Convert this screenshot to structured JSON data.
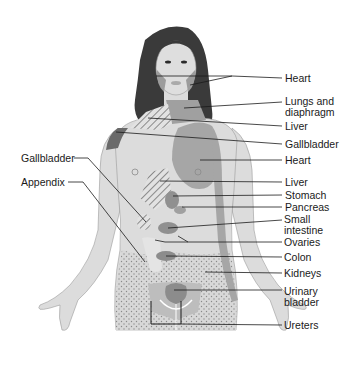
{
  "diagram": {
    "type": "referred-pain-anatomy",
    "colors": {
      "skin": "#dcdcdc",
      "hair": "#3a3a3a",
      "organ_dark": "#8c8c8c",
      "organ_mid": "#a6a6a6",
      "leader_line": "#1a1a1a",
      "text": "#1a1a1a",
      "background": "#ffffff"
    }
  },
  "labels_right": [
    {
      "id": "heart-jaw",
      "text": "Heart"
    },
    {
      "id": "lungs",
      "text": "Lungs and diaphragm"
    },
    {
      "id": "liver-neck",
      "text": "Liver"
    },
    {
      "id": "gallbladder-shoulder",
      "text": "Gallbladder"
    },
    {
      "id": "heart-chest",
      "text": "Heart"
    },
    {
      "id": "liver-abdomen",
      "text": "Liver"
    },
    {
      "id": "stomach",
      "text": "Stomach"
    },
    {
      "id": "pancreas",
      "text": "Pancreas"
    },
    {
      "id": "small-intestine",
      "text": "Small intestine"
    },
    {
      "id": "ovaries",
      "text": "Ovaries"
    },
    {
      "id": "colon",
      "text": "Colon"
    },
    {
      "id": "kidneys",
      "text": "Kidneys"
    },
    {
      "id": "urinary-bladder",
      "text": "Urinary bladder"
    },
    {
      "id": "ureters",
      "text": "Ureters"
    }
  ],
  "labels_left": [
    {
      "id": "gallbladder-abdomen",
      "text": "Gallbladder"
    },
    {
      "id": "appendix",
      "text": "Appendix"
    }
  ]
}
